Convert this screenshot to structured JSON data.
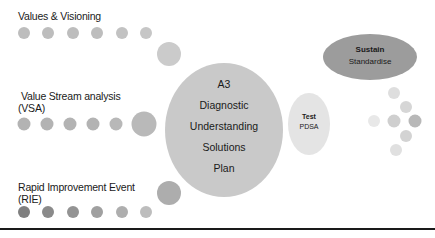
{
  "labels": {
    "values_visioning": "Values & Visioning",
    "vsa_line1": "Value Stream analysis",
    "vsa_line2": "(VSA)",
    "rie_line1": "Rapid Improvement Event",
    "rie_line2": "(RIE)"
  },
  "a3": {
    "lines": [
      "A3",
      "Diagnostic",
      "Understanding",
      "Solutions",
      "Plan"
    ]
  },
  "test": {
    "title": "Test",
    "subtitle": "PDSA"
  },
  "sustain": {
    "title": "Sustain",
    "subtitle": "Standardise"
  },
  "colors": {
    "a3_fill": "#c9c9c9",
    "test_fill": "#e4e4e4",
    "sustain_fill": "#9c9c9c",
    "dot_light": "#d2d2d2",
    "dot_mid": "#b5b5b5",
    "dot_dark": "#8c8c8c",
    "rule": "#1a1a1a"
  },
  "rows": {
    "values_dots": [
      "#bdbdbd",
      "#bdbdbd",
      "#bdbdbd",
      "#bdbdbd",
      "#c2c2c2",
      "#c6c6c6"
    ],
    "vsa_dots": [
      "#b3b3b3",
      "#b3b3b3",
      "#b3b3b3",
      "#b3b3b3",
      "#b8b8b8"
    ],
    "rie_dots": [
      "#7f7f7f",
      "#8a8a8a",
      "#939393",
      "#a0a0a0",
      "#aeaeae",
      "#bdbdbd"
    ]
  }
}
